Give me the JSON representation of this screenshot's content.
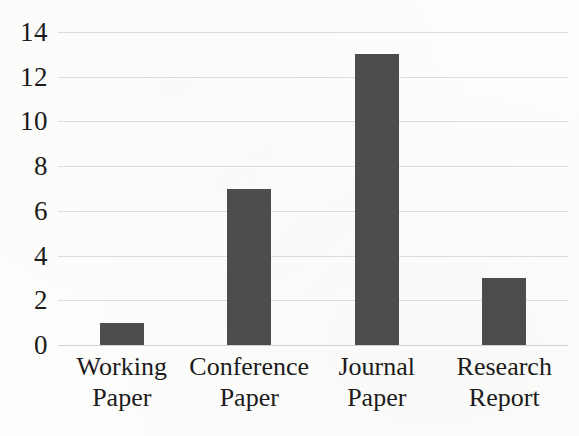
{
  "chart_data": {
    "type": "bar",
    "title": "",
    "subtitle": "",
    "xlabel": "",
    "ylabel": "",
    "categories": [
      "Working Paper",
      "Conference Paper",
      "Journal Paper",
      "Research Report"
    ],
    "category_lines": [
      [
        "Working",
        "Paper"
      ],
      [
        "Conference",
        "Paper"
      ],
      [
        "Journal",
        "Paper"
      ],
      [
        "Research",
        "Report"
      ]
    ],
    "values": [
      1,
      7,
      13,
      3
    ],
    "ylim": [
      0,
      14
    ],
    "ytick_values": [
      0,
      2,
      4,
      6,
      8,
      10,
      12,
      14
    ],
    "ytick_labels": [
      "0",
      "2",
      "4",
      "6",
      "8",
      "10",
      "12",
      "14"
    ],
    "grid": true,
    "grid_axis": "y",
    "legend": false,
    "legend_position": "none",
    "bar_color": "#4d4d4d",
    "gridline_color": "#dedede",
    "background_color": "#fdfdfc",
    "text_color": "#1b1b1b"
  }
}
